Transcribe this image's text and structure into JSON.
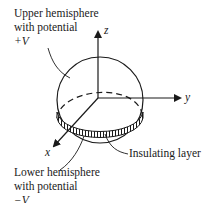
{
  "diagram": {
    "labels": {
      "upper_line1": "Upper hemisphere",
      "upper_line2": "with potential",
      "upper_line3": "+V",
      "lower_line1": "Lower hemisphere",
      "lower_line2": "with potential",
      "lower_line3": "−V",
      "insulating": "Insulating layer"
    },
    "axes": {
      "x": "x",
      "y": "y",
      "z": "z"
    },
    "colors": {
      "stroke": "#1a1a1a",
      "background": "#ffffff"
    }
  }
}
